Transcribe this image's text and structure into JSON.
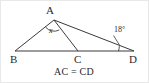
{
  "figure": {
    "name": "triangle-geometry-diagram",
    "type": "geometry-figure",
    "stroke_color": "#3a3a3a",
    "text_color": "#2a2a2a",
    "background_color": "#ffffff",
    "vertices": {
      "A": {
        "label": "A",
        "x": 53,
        "y": 19
      },
      "B": {
        "label": "B",
        "x": 14,
        "y": 50
      },
      "C": {
        "label": "C",
        "x": 77,
        "y": 50
      },
      "D": {
        "label": "D",
        "x": 133,
        "y": 50
      }
    },
    "segments": [
      {
        "name": "segment-BD",
        "from": "B",
        "to": "D"
      },
      {
        "name": "segment-AB",
        "from": "A",
        "to": "B"
      },
      {
        "name": "segment-AC",
        "from": "A",
        "to": "C"
      },
      {
        "name": "segment-AD",
        "from": "A",
        "to": "D"
      }
    ],
    "angles": [
      {
        "name": "angle-at-A",
        "vertex": "A",
        "label": "x",
        "italic": true,
        "marker": "arc",
        "between": [
          "B",
          "C"
        ]
      },
      {
        "name": "angle-at-D",
        "vertex": "D",
        "label": "18°",
        "italic": false,
        "marker": "arc",
        "between": [
          "A",
          "B"
        ]
      }
    ],
    "caption": "AC = CD"
  }
}
